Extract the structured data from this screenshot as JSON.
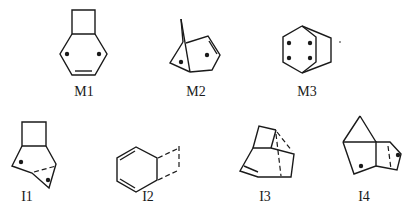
{
  "diagram": {
    "type": "chemical-structures",
    "structures": [
      {
        "id": "M1",
        "label": "M1",
        "description": "bicyclo[4.2.0]octa-diene diradical: cyclobutane fused to six-membered ring with one double bond and two radical centers"
      },
      {
        "id": "M2",
        "label": "M2",
        "description": "bridged bicyclic diradical with one double bond"
      },
      {
        "id": "M3",
        "label": "M3",
        "description": "bicyclo[2.2.2]octane skeleton with four radical centers"
      },
      {
        "id": "I1",
        "label": "I1",
        "description": "cyclobutane-fused bicyclic intermediate with dashed partial bond and two radical centers"
      },
      {
        "id": "I2",
        "label": "I2",
        "description": "cyclohexadiene with dashed partial bonds to a bridging fragment"
      },
      {
        "id": "I3",
        "label": "I3",
        "description": "tricyclic intermediate with double bond and dashed partial bonds"
      },
      {
        "id": "I4",
        "label": "I4",
        "description": "bridged tricyclic intermediate with two radical centers and dashed partial bond"
      }
    ]
  }
}
